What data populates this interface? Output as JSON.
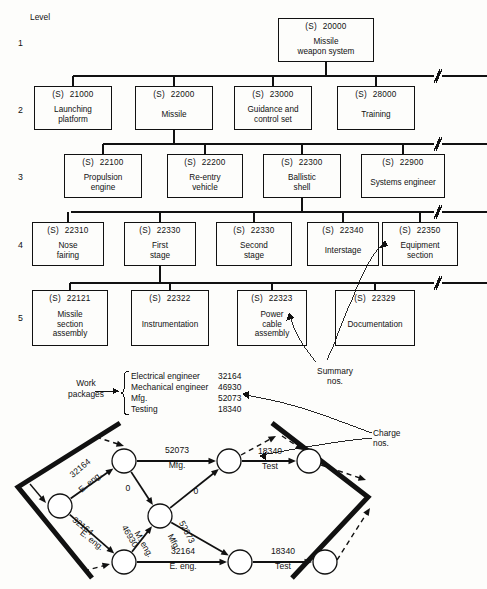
{
  "meta": {
    "level_header": "Level",
    "levels": [
      "1",
      "2",
      "3",
      "4",
      "5"
    ],
    "code_prefix": "(S)"
  },
  "wbs": {
    "level1": [
      {
        "code": "20000",
        "title": "Missile\nweapon system",
        "x": 278,
        "y": 18,
        "w": 96,
        "h": 44
      }
    ],
    "level2": [
      {
        "code": "21000",
        "title": "Launching\nplatform",
        "x": 34,
        "y": 86,
        "w": 78,
        "h": 44
      },
      {
        "code": "22000",
        "title": "Missile",
        "x": 135,
        "y": 86,
        "w": 78,
        "h": 44
      },
      {
        "code": "23000",
        "title": "Guidance and\ncontrol set",
        "x": 234,
        "y": 86,
        "w": 78,
        "h": 44
      },
      {
        "code": "28000",
        "title": "Training",
        "x": 337,
        "y": 86,
        "w": 78,
        "h": 44
      }
    ],
    "level3": [
      {
        "code": "22100",
        "title": "Propulsion\nengine",
        "x": 64,
        "y": 154,
        "w": 78,
        "h": 44
      },
      {
        "code": "22200",
        "title": "Re-entry\nvehicle",
        "x": 167,
        "y": 154,
        "w": 76,
        "h": 44
      },
      {
        "code": "22300",
        "title": "Ballistic\nshell",
        "x": 263,
        "y": 154,
        "w": 78,
        "h": 44
      },
      {
        "code": "22900",
        "title": "Systems engineer",
        "x": 361,
        "y": 154,
        "w": 84,
        "h": 44
      }
    ],
    "level4": [
      {
        "code": "22310",
        "title": "Nose\nfairing",
        "x": 32,
        "y": 222,
        "w": 72,
        "h": 44
      },
      {
        "code": "22330",
        "title": "First\nstage",
        "x": 124,
        "y": 222,
        "w": 72,
        "h": 44
      },
      {
        "code": "22330",
        "title": "Second\nstage",
        "x": 216,
        "y": 222,
        "w": 76,
        "h": 44
      },
      {
        "code": "22340",
        "title": "Interstage",
        "x": 307,
        "y": 222,
        "w": 72,
        "h": 44
      },
      {
        "code": "22350",
        "title": "Equipment\nsection",
        "x": 382,
        "y": 222,
        "w": 76,
        "h": 44
      }
    ],
    "level5": [
      {
        "code": "22121",
        "title": "Missile\nsection\nassembly",
        "x": 32,
        "y": 290,
        "w": 76,
        "h": 56
      },
      {
        "code": "22322",
        "title": "Instrumentation",
        "x": 131,
        "y": 290,
        "w": 78,
        "h": 56
      },
      {
        "code": "22323",
        "title": "Power\ncable\nassembly",
        "x": 237,
        "y": 290,
        "w": 70,
        "h": 56
      },
      {
        "code": "22329",
        "title": "Documentation",
        "x": 335,
        "y": 290,
        "w": 80,
        "h": 56
      }
    ]
  },
  "annotations": {
    "summary_nos": "Summary\nnos.",
    "charge_nos": "Charge\nnos.",
    "work_packages": "Work\npackages"
  },
  "work_packages": {
    "rows": [
      {
        "name": "Electrical engineer",
        "number": "32164"
      },
      {
        "name": "Mechanical engineer",
        "number": "46930"
      },
      {
        "name": "Mfg.",
        "number": "52073"
      },
      {
        "name": "Testing",
        "number": "18340"
      }
    ]
  },
  "chart_data": {
    "type": "diagram",
    "network": {
      "nodes": [
        {
          "id": "n1",
          "x": 60,
          "y": 506,
          "r": 12
        },
        {
          "id": "n2",
          "x": 124,
          "y": 461,
          "r": 12
        },
        {
          "id": "n3",
          "x": 160,
          "y": 516,
          "r": 12
        },
        {
          "id": "n4",
          "x": 124,
          "y": 562,
          "r": 12
        },
        {
          "id": "n5",
          "x": 229,
          "y": 461,
          "r": 12
        },
        {
          "id": "n6",
          "x": 240,
          "y": 562,
          "r": 12
        },
        {
          "id": "n7",
          "x": 309,
          "y": 461,
          "r": 12
        },
        {
          "id": "n8",
          "x": 325,
          "y": 562,
          "r": 12
        }
      ],
      "arcs": [
        {
          "from": "n1",
          "to": "n2",
          "number": "32164",
          "resource": "E. eng.",
          "style": "solid"
        },
        {
          "from": "n1",
          "to": "n4",
          "number": "32164",
          "resource": "E. eng.",
          "style": "solid"
        },
        {
          "from": "n2",
          "to": "n5",
          "number": "52073",
          "resource": "Mfg.",
          "style": "solid"
        },
        {
          "from": "n2",
          "to": "n3",
          "number": "0",
          "resource": "",
          "style": "solid"
        },
        {
          "from": "n4",
          "to": "n3",
          "number": "46930",
          "resource": "M. eng.",
          "style": "solid"
        },
        {
          "from": "n3",
          "to": "n5",
          "number": "0",
          "resource": "",
          "style": "solid"
        },
        {
          "from": "n3",
          "to": "n6",
          "number": "52073",
          "resource": "Mfg.",
          "style": "solid"
        },
        {
          "from": "n4",
          "to": "n6",
          "number": "32164",
          "resource": "E. eng.",
          "style": "solid"
        },
        {
          "from": "n5",
          "to": "n7",
          "number": "18340",
          "resource": "Test",
          "style": "solid"
        },
        {
          "from": "n6",
          "to": "n8",
          "number": "18340",
          "resource": "Test",
          "style": "solid"
        }
      ]
    }
  }
}
